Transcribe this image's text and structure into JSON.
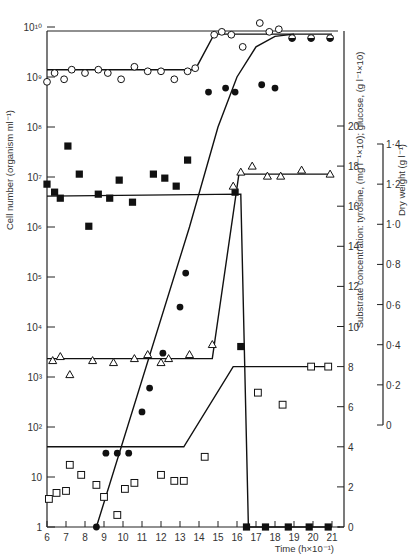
{
  "chart_data": {
    "type": "scatter",
    "title": "",
    "xlabel": "Time (h×10⁻¹)",
    "x_ticks": [
      "6",
      "7",
      "8",
      "9",
      "10",
      "11",
      "12",
      "13",
      "14",
      "15",
      "16",
      "17",
      "18",
      "19",
      "20",
      "21"
    ],
    "xlim": [
      6,
      21
    ],
    "axes": {
      "left": {
        "label": "Cell number (organism ml⁻¹)",
        "scale": "log",
        "ticks": [
          "1",
          "10",
          "10²",
          "10³",
          "10⁴",
          "10⁵",
          "10⁶",
          "10⁷",
          "10⁸",
          "10⁹",
          "10¹⁰"
        ],
        "ylim": [
          1,
          10000000000.0
        ]
      },
      "right_substrate": {
        "label": "Substrate concentration: tyrosine, (mg l⁻¹×10); glucose, (g l⁻¹×10)",
        "scale": "linear",
        "ticks": [
          "0",
          "2",
          "4",
          "6",
          "8",
          "10",
          "12",
          "14",
          "16",
          "18",
          "20"
        ],
        "ylim": [
          0,
          20
        ]
      },
      "right_dryweight": {
        "label": "Dry weight (g l⁻¹)",
        "scale": "linear",
        "ticks": [
          "0",
          "0·2",
          "0·4",
          "0·6",
          "0·8",
          "1·0",
          "1·2",
          "1·4"
        ],
        "ylim": [
          0,
          1.4
        ]
      }
    },
    "grid": false,
    "legend": "none",
    "series": [
      {
        "name": "Open circles (cell number, log axis)",
        "marker": "open-circle",
        "axis": "left",
        "points": [
          [
            6.0,
            800000000.0
          ],
          [
            6.4,
            1200000000.0
          ],
          [
            6.9,
            900000000.0
          ],
          [
            7.3,
            1400000000.0
          ],
          [
            8.0,
            1200000000.0
          ],
          [
            8.7,
            1400000000.0
          ],
          [
            9.2,
            1200000000.0
          ],
          [
            9.9,
            900000000.0
          ],
          [
            10.6,
            1600000000.0
          ],
          [
            11.3,
            1300000000.0
          ],
          [
            12.0,
            1300000000.0
          ],
          [
            12.7,
            900000000.0
          ],
          [
            13.4,
            1300000000.0
          ],
          [
            13.8,
            1500000000.0
          ],
          [
            14.8,
            7000000000.0
          ],
          [
            15.2,
            8000000000.0
          ],
          [
            15.7,
            7000000000.0
          ],
          [
            16.3,
            4000000000.0
          ],
          [
            17.2,
            12000000000.0
          ],
          [
            17.7,
            8000000000.0
          ],
          [
            18.2,
            9000000000.0
          ]
        ]
      },
      {
        "name": "Half-filled circles (cell number, log axis)",
        "marker": "half-circle",
        "axis": "left",
        "points": [
          [
            18.9,
            6000000000.0
          ],
          [
            19.9,
            6000000000.0
          ],
          [
            20.9,
            6000000000.0
          ]
        ]
      },
      {
        "name": "Filled circles (cell number, log axis)",
        "marker": "filled-circle",
        "axis": "left",
        "points": [
          [
            8.6,
            1
          ],
          [
            9.1,
            30
          ],
          [
            9.7,
            30
          ],
          [
            10.3,
            30
          ],
          [
            11.0,
            200
          ],
          [
            11.4,
            600
          ],
          [
            12.1,
            3000
          ],
          [
            13.0,
            25000.0
          ],
          [
            13.3,
            120000.0
          ],
          [
            14.5,
            500000000.0
          ],
          [
            15.4,
            600000000.0
          ],
          [
            15.9,
            500000000.0
          ],
          [
            17.3,
            700000000.0
          ],
          [
            18.0,
            600000000.0
          ]
        ]
      },
      {
        "name": "Filled squares (substrate, right axis)",
        "marker": "filled-square",
        "axis": "right_substrate",
        "points": [
          [
            6.0,
            17.1
          ],
          [
            6.4,
            16.7
          ],
          [
            6.7,
            16.4
          ],
          [
            7.1,
            19.0
          ],
          [
            7.7,
            17.6
          ],
          [
            8.2,
            15.0
          ],
          [
            8.7,
            16.6
          ],
          [
            9.3,
            16.4
          ],
          [
            9.8,
            17.3
          ],
          [
            10.5,
            16.2
          ],
          [
            11.6,
            17.6
          ],
          [
            12.2,
            17.4
          ],
          [
            12.8,
            17.0
          ],
          [
            13.4,
            18.3
          ],
          [
            15.9,
            16.7
          ],
          [
            16.2,
            9.0
          ],
          [
            16.5,
            0
          ],
          [
            17.5,
            0
          ],
          [
            18.7,
            0
          ],
          [
            19.8,
            0
          ],
          [
            20.8,
            0
          ]
        ]
      },
      {
        "name": "Open triangles (substrate, right axis)",
        "marker": "open-triangle",
        "axis": "right_substrate",
        "points": [
          [
            6.3,
            8.3
          ],
          [
            6.7,
            8.5
          ],
          [
            7.2,
            7.6
          ],
          [
            8.4,
            8.3
          ],
          [
            9.5,
            8.2
          ],
          [
            10.6,
            8.4
          ],
          [
            11.3,
            8.6
          ],
          [
            12.0,
            8.2
          ],
          [
            12.4,
            8.4
          ],
          [
            13.5,
            8.6
          ],
          [
            14.7,
            9.1
          ],
          [
            15.8,
            17.0
          ],
          [
            16.2,
            17.7
          ],
          [
            16.8,
            18.0
          ],
          [
            17.6,
            17.5
          ],
          [
            18.3,
            17.5
          ],
          [
            19.4,
            17.8
          ],
          [
            20.9,
            17.6
          ]
        ]
      },
      {
        "name": "Open squares (substrate, right axis)",
        "marker": "open-square",
        "axis": "right_substrate",
        "points": [
          [
            6.1,
            1.4
          ],
          [
            6.5,
            1.7
          ],
          [
            7.0,
            1.8
          ],
          [
            7.2,
            3.1
          ],
          [
            7.8,
            2.6
          ],
          [
            8.6,
            2.1
          ],
          [
            9.0,
            1.5
          ],
          [
            9.7,
            0.6
          ],
          [
            10.1,
            1.9
          ],
          [
            10.6,
            2.2
          ],
          [
            12.0,
            2.6
          ],
          [
            12.7,
            2.3
          ],
          [
            13.2,
            2.3
          ],
          [
            14.3,
            3.5
          ],
          [
            17.1,
            6.7
          ],
          [
            18.4,
            6.1
          ],
          [
            19.9,
            8.0
          ],
          [
            20.8,
            8.0
          ]
        ]
      }
    ],
    "fit_lines": [
      {
        "name": "open circles fit",
        "axis": "left",
        "points": [
          [
            6.0,
            1400000000.0
          ],
          [
            13.8,
            1400000000.0
          ],
          [
            14.8,
            7200000000.0
          ],
          [
            21.0,
            7200000000.0
          ]
        ]
      },
      {
        "name": "filled circles growth curve",
        "axis": "left",
        "points": [
          [
            8.6,
            1
          ],
          [
            13.5,
            1000000.0
          ],
          [
            15.0,
            100000000.0
          ],
          [
            16.0,
            1000000000.0
          ],
          [
            17.0,
            4000000000.0
          ],
          [
            18.0,
            6500000000.0
          ],
          [
            19.0,
            7200000000.0
          ]
        ]
      },
      {
        "name": "filled squares fit",
        "axis": "right_substrate",
        "points": [
          [
            6.0,
            16.5
          ],
          [
            16.2,
            16.6
          ],
          [
            16.6,
            0
          ],
          [
            21.0,
            0
          ]
        ]
      },
      {
        "name": "open triangles fit",
        "axis": "right_substrate",
        "points": [
          [
            6.0,
            8.4
          ],
          [
            14.7,
            8.4
          ],
          [
            16.1,
            17.6
          ],
          [
            21.0,
            17.6
          ]
        ]
      },
      {
        "name": "open squares fit",
        "axis": "right_substrate",
        "points": [
          [
            6.0,
            4.0
          ],
          [
            13.2,
            4.0
          ],
          [
            15.8,
            8.0
          ],
          [
            21.0,
            8.0
          ]
        ]
      }
    ]
  }
}
